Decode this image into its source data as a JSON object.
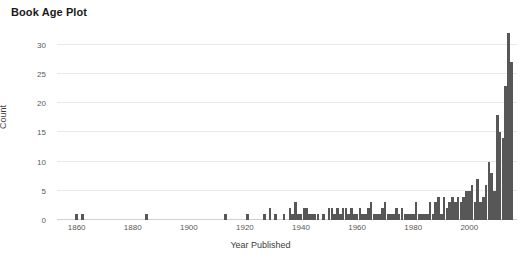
{
  "chart_data": {
    "type": "bar",
    "title": "Book Age Plot",
    "xlabel": "Year Published",
    "ylabel": "Count",
    "xlim": [
      1853,
      2017
    ],
    "ylim": [
      0,
      32
    ],
    "grid": true,
    "legend": null,
    "bar_color": "#575757",
    "grid_color": "#e9e9e9",
    "xticks": [
      1860,
      1880,
      1900,
      1920,
      1940,
      1960,
      1980,
      2000
    ],
    "yticks": [
      0,
      5,
      10,
      15,
      20,
      25,
      30
    ],
    "x": [
      1860,
      1862,
      1885,
      1913,
      1921,
      1927,
      1929,
      1931,
      1934,
      1936,
      1937,
      1938,
      1939,
      1940,
      1941,
      1942,
      1943,
      1944,
      1945,
      1946,
      1948,
      1950,
      1951,
      1952,
      1953,
      1954,
      1955,
      1956,
      1957,
      1958,
      1959,
      1960,
      1961,
      1962,
      1963,
      1964,
      1965,
      1966,
      1967,
      1968,
      1969,
      1970,
      1971,
      1972,
      1973,
      1974,
      1975,
      1976,
      1977,
      1978,
      1979,
      1980,
      1981,
      1982,
      1983,
      1984,
      1985,
      1986,
      1987,
      1988,
      1989,
      1990,
      1991,
      1992,
      1993,
      1994,
      1995,
      1996,
      1997,
      1998,
      1999,
      2000,
      2001,
      2002,
      2003,
      2004,
      2005,
      2006,
      2007,
      2008,
      2009,
      2010,
      2011,
      2012,
      2013,
      2014,
      2015
    ],
    "values": [
      1,
      1,
      1,
      1,
      1,
      1,
      2,
      1,
      1,
      2,
      1,
      3,
      1,
      1,
      2,
      2,
      1,
      1,
      1,
      1,
      1,
      2,
      2,
      1,
      2,
      1,
      2,
      2,
      1,
      2,
      1,
      1,
      2,
      1,
      1,
      2,
      3,
      1,
      1,
      1,
      2,
      3,
      1,
      1,
      1,
      2,
      1,
      2,
      1,
      1,
      1,
      1,
      3,
      1,
      1,
      1,
      1,
      3,
      1,
      3,
      4,
      1,
      4,
      2,
      3,
      4,
      3,
      4,
      3,
      4,
      5,
      5,
      6,
      3,
      7,
      3,
      4,
      6,
      10,
      8,
      5,
      18,
      15,
      14,
      23,
      32,
      27
    ]
  },
  "axes": {
    "y_label": "Count",
    "x_label": "Year Published"
  }
}
